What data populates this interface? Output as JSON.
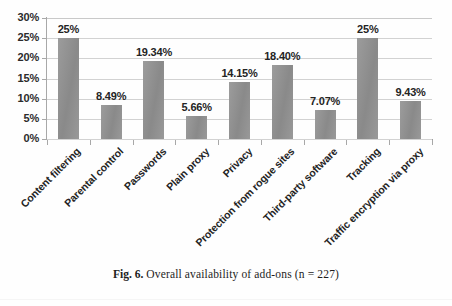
{
  "caption": {
    "number": "Fig. 6.",
    "text": "Overall availability of add-ons (n = 227)"
  },
  "chart_data": {
    "type": "bar",
    "title": "",
    "xlabel": "",
    "ylabel": "",
    "ylim": [
      0,
      30
    ],
    "ytick_labels": [
      "0%",
      "5%",
      "10%",
      "15%",
      "20%",
      "25%",
      "30%"
    ],
    "ytick_values": [
      0,
      5,
      10,
      15,
      20,
      25,
      30
    ],
    "grid": true,
    "legend": "none",
    "bar_color": "#919191",
    "categories": [
      "Content filtering",
      "Parental control",
      "Passwords",
      "Plain proxy",
      "Privacy",
      "Protection from rogue sites",
      "Third-party software",
      "Tracking",
      "Traffic encryption via proxy"
    ],
    "values": [
      25,
      8.49,
      19.34,
      5.66,
      14.15,
      18.4,
      7.07,
      25,
      9.43
    ],
    "data_labels": [
      "25%",
      "8.49%",
      "19.34%",
      "5.66%",
      "14.15%",
      "18.40%",
      "7.07%",
      "25%",
      "9.43%"
    ]
  }
}
